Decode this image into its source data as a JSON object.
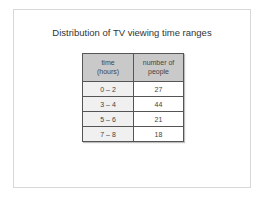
{
  "title": "Distribution of TV viewing time ranges",
  "table": {
    "headers": [
      {
        "line1": "time",
        "line2": "(hours)"
      },
      {
        "line1": "number of",
        "line2": "people"
      }
    ],
    "rows": [
      {
        "range": "0 – 2",
        "count": "27"
      },
      {
        "range": "3 – 4",
        "count": "44"
      },
      {
        "range": "5 – 6",
        "count": "21"
      },
      {
        "range": "7 – 8",
        "count": "18"
      }
    ]
  }
}
